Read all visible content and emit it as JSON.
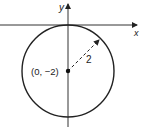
{
  "diagram": {
    "type": "circle-on-axes",
    "x_axis_label": "x",
    "y_axis_label": "y",
    "center_label": "(0, −2)",
    "radius_label": "2",
    "center": [
      0,
      -2
    ],
    "radius": 2,
    "colors": {
      "stroke": "#222222",
      "background": "#ffffff"
    }
  }
}
